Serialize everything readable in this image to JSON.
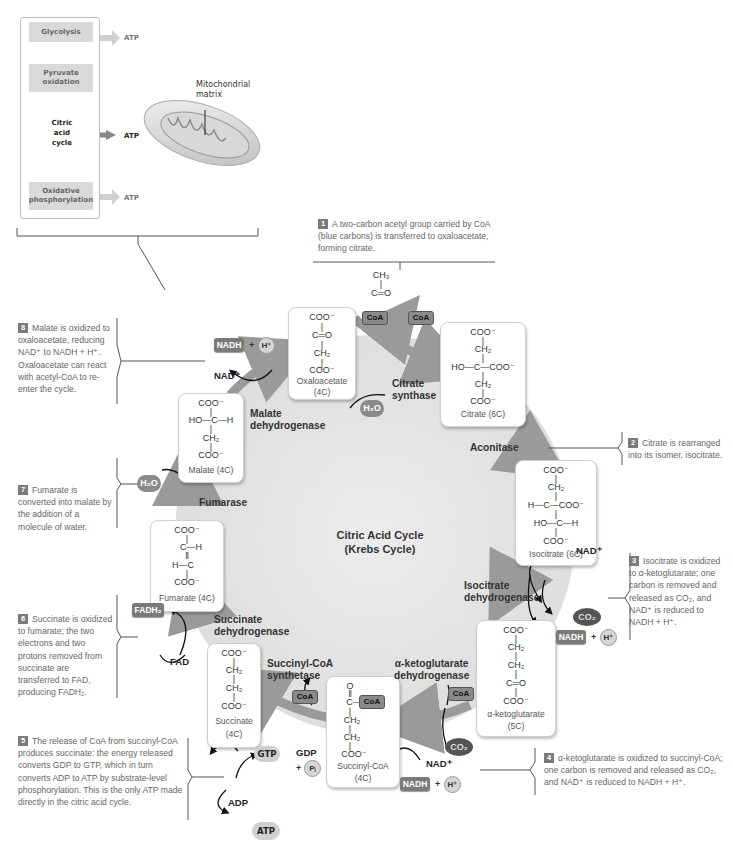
{
  "overview": {
    "steps": [
      "Glycolysis",
      "Pyruvate oxidation",
      "Citric acid cycle",
      "Oxidative phosphorylation"
    ],
    "cycle_label": [
      "Citric",
      "acid",
      "cycle"
    ],
    "atp_labels": [
      "ATP",
      "ATP",
      "ATP"
    ],
    "mitochondrion_label": "Mitochondrial matrix"
  },
  "center": {
    "title_line1": "Citric Acid Cycle",
    "title_line2": "(Krebs Cycle)"
  },
  "molecules": {
    "oxaloacetate": {
      "lines": [
        "COO⁻",
        "|",
        "C═O",
        "|",
        "CH₂",
        "|",
        "COO⁻"
      ],
      "name": "Oxaloacetate",
      "carbons": "(4C)"
    },
    "citrate": {
      "lines": [
        "COO⁻",
        "|",
        "CH₂",
        "|",
        "HO—C—COO⁻",
        "|",
        "CH₂",
        "|",
        "COO⁻"
      ],
      "name": "Citrate (6C)"
    },
    "isocitrate": {
      "lines": [
        "COO⁻",
        "|",
        "CH₂",
        "|",
        "H—C—COO⁻",
        "|",
        "HO—C—H",
        "|",
        "COO⁻"
      ],
      "name": "Isocitrate (6C)"
    },
    "alpha_ketoglutarate": {
      "lines": [
        "COO⁻",
        "|",
        "CH₂",
        "|",
        "CH₂",
        "|",
        "C═O",
        "|",
        "COO⁻"
      ],
      "name": "α-ketoglutarate",
      "carbons": "(5C)"
    },
    "succinyl_coa": {
      "lines": [
        "O",
        "‖",
        "C—",
        "|",
        "CH₂",
        "|",
        "CH₂",
        "|",
        "COO⁻"
      ],
      "coa": "CoA",
      "name": "Succinyl-CoA",
      "carbons": "(4C)"
    },
    "succinate": {
      "lines": [
        "COO⁻",
        "|",
        "CH₂",
        "|",
        "CH₂",
        "|",
        "COO⁻"
      ],
      "name": "Succinate",
      "carbons": "(4C)"
    },
    "fumarate": {
      "lines": [
        "COO⁻",
        "|",
        "C—H",
        "‖",
        "H—C",
        "|",
        "COO⁻"
      ],
      "name": "Fumarate (4C)"
    },
    "malate": {
      "lines": [
        "COO⁻",
        "|",
        "HO—C—H",
        "|",
        "CH₂",
        "|",
        "COO⁻"
      ],
      "name": "Malate (4C)"
    },
    "acetyl": {
      "lines": [
        "CH₃",
        "|",
        "C═O"
      ],
      "coa": "CoA"
    }
  },
  "enzymes": {
    "citrate_synthase": [
      "Citrate",
      "synthase"
    ],
    "aconitase": [
      "Aconitase"
    ],
    "isocitrate_dehydrogenase": [
      "Isocitrate",
      "dehydrogenase"
    ],
    "akg_dehydrogenase": [
      "α-ketoglutarate",
      "dehydrogenase"
    ],
    "succinyl_coa_synthetase": [
      "Succinyl-CoA",
      "synthetase"
    ],
    "succinate_dehydrogenase": [
      "Succinate",
      "dehydrogenase"
    ],
    "fumarase": [
      "Fumarase"
    ],
    "malate_dehydrogenase": [
      "Malate",
      "dehydrogenase"
    ]
  },
  "cofactors": {
    "coa": "CoA",
    "nadh": "NADH",
    "nad": "NAD⁺",
    "h": "H⁺",
    "h2o": "H₂O",
    "co2": "CO₂",
    "fadh2": "FADH₂",
    "fad": "FAD",
    "gtp": "GTP",
    "gdp": "GDP",
    "pi": "Pᵢ",
    "adp": "ADP",
    "atp": "ATP",
    "plus": "+"
  },
  "notes": [
    {
      "num": "1",
      "text": "A two-carbon acetyl group carried by CoA (blue carbons) is transferred to oxaloacetate, forming citrate."
    },
    {
      "num": "2",
      "text": "Citrate is rearranged into its isomer, isocitrate."
    },
    {
      "num": "3",
      "text": "Isocitrate is oxidized to α-ketoglutarate; one carbon is removed and released as CO₂, and NAD⁺ is reduced to NADH + H⁺."
    },
    {
      "num": "4",
      "text": "α-ketoglutarate is oxidized to succinyl-CoA; one carbon is removed and released as CO₂, and NAD⁺ is reduced to NADH + H⁺."
    },
    {
      "num": "5",
      "text": "The release of CoA from succinyl-CoA produces succinate: the energy released converts GDP to GTP, which in turn converts ADP to ATP by substrate-level phosphorylation. This is the only ATP made directly in the citric acid cycle."
    },
    {
      "num": "6",
      "text": "Succinate is oxidized to fumarate; the two electrons and two protons removed from succinate are transferred to FAD, producing FADH₂."
    },
    {
      "num": "7",
      "text": "Fumarate is converted into malate by the addition of a molecule of water."
    },
    {
      "num": "8",
      "text": "Malate is oxidized to oxaloacetate, reducing NAD⁺ to NADH + H⁺. Oxaloacetate can react with acetyl-CoA to re-enter the cycle."
    }
  ],
  "colors": {
    "cycle_fill": "#e6e6e6",
    "arrow": "#9a9a9a",
    "pill": "#7a7a7a",
    "note_text": "#666666",
    "box_border": "#cfcfcf"
  }
}
